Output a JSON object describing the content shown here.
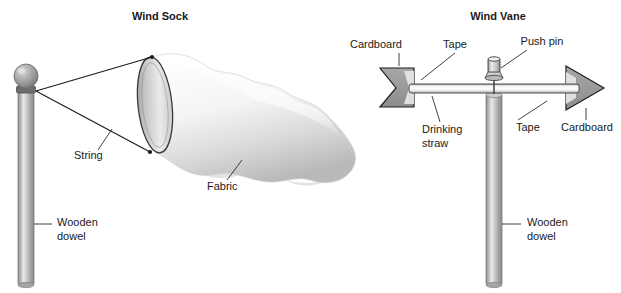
{
  "figure": {
    "width": 621,
    "height": 293,
    "background": "#ffffff"
  },
  "panels": [
    {
      "id": "wind-sock",
      "title": "Wind Sock",
      "title_x": 160,
      "title_y": 20,
      "labels": [
        {
          "name": "string",
          "text": "String",
          "x": 74,
          "y": 159
        },
        {
          "name": "fabric",
          "text": "Fabric",
          "x": 207,
          "y": 190
        },
        {
          "name": "wooden-dowel-line1",
          "text": "Wooden",
          "x": 57,
          "y": 226
        },
        {
          "name": "wooden-dowel-line2",
          "text": "dowel",
          "x": 57,
          "y": 240
        }
      ]
    },
    {
      "id": "wind-vane",
      "title": "Wind Vane",
      "title_x": 498,
      "title_y": 20,
      "labels": [
        {
          "name": "cardboard-left",
          "text": "Cardboard",
          "x": 376,
          "y": 48
        },
        {
          "name": "tape-left",
          "text": "Tape",
          "x": 449,
          "y": 48
        },
        {
          "name": "push-pin",
          "text": "Push pin",
          "x": 518,
          "y": 45
        },
        {
          "name": "drinking-straw-line1",
          "text": "Drinking",
          "x": 422,
          "y": 133
        },
        {
          "name": "drinking-straw-line2",
          "text": "straw",
          "x": 422,
          "y": 147
        },
        {
          "name": "tape-right",
          "text": "Tape",
          "x": 516,
          "y": 131
        },
        {
          "name": "cardboard-right",
          "text": "Cardboard",
          "x": 561,
          "y": 131
        },
        {
          "name": "wooden-dowel-line1",
          "text": "Wooden",
          "x": 527,
          "y": 226
        },
        {
          "name": "wooden-dowel-line2",
          "text": "dowel",
          "x": 527,
          "y": 240
        }
      ]
    }
  ],
  "colors": {
    "text": "#1a1a1a",
    "outline": "#1a1a1a",
    "leader": "#2b2b2b",
    "dowel_light": "#f2f2f2",
    "dowel_mid": "#b8b8b8",
    "dowel_dark": "#8d8d8d",
    "cardboard_fill": "#9a9a9a",
    "cardboard_light": "#b5b5b5",
    "tape_fill": "#e2e2e2",
    "fabric_light": "#ffffff",
    "fabric_shadow": "#c9c9c9",
    "opening_fill": "#d6d6d6"
  }
}
